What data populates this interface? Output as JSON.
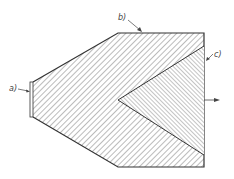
{
  "diagram": {
    "type": "cross-section",
    "labels": {
      "a": "a)",
      "b": "b)",
      "c": "c)"
    },
    "colors": {
      "line": "#333333",
      "hatch": "#555555",
      "background": "#ffffff"
    },
    "parts": [
      {
        "id": "a",
        "description": "thin plate at left (input face)"
      },
      {
        "id": "b",
        "description": "outer hatched body, tapered horn shape"
      },
      {
        "id": "c",
        "description": "inner triangular wedge with finer hatching"
      }
    ],
    "output_arrow": "arrow pointing right from right face"
  }
}
